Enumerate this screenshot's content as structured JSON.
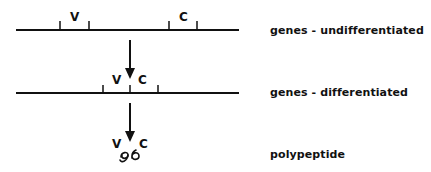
{
  "diagram": {
    "stages": [
      {
        "id": "undifferentiated",
        "label": "genes - undifferentiated"
      },
      {
        "id": "differentiated",
        "label": "genes - differentiated"
      },
      {
        "id": "polypeptide",
        "label": "polypeptide"
      }
    ],
    "segments": {
      "v": "V",
      "c": "C"
    },
    "colors": {
      "ink": "#111111",
      "background": "#ffffff"
    }
  }
}
